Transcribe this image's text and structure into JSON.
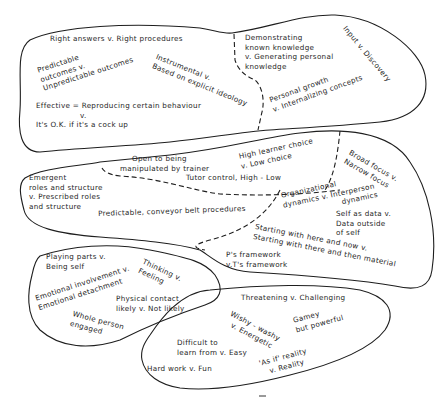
{
  "diagram": {
    "type": "cluster-map",
    "colors": {
      "ink": "#1e1e1e",
      "background": "#ffffff"
    },
    "clusters": [
      {
        "id": "cluster-1",
        "labels": [
          {
            "lines": [
              "Right answers  v.  Right procedures"
            ]
          },
          {
            "lines": [
              "Predictable",
              "outcomes v.",
              "Unpredictable outcomes"
            ]
          },
          {
            "lines": [
              "Instrumental v.",
              "Based on explicit ideology"
            ]
          },
          {
            "lines": [
              "Effective = Reproducing certain behaviour",
              "v.",
              "It's O.K. if it's a cock up"
            ]
          },
          {
            "lines": [
              "Demonstrating",
              "known knowledge",
              "v. Generating personal",
              "knowledge"
            ]
          },
          {
            "lines": [
              "Personal growth",
              "v. Internalizing concepts"
            ]
          },
          {
            "lines": [
              "Input v. Discovery"
            ]
          }
        ]
      },
      {
        "id": "cluster-2",
        "labels": [
          {
            "lines": [
              "Open to being",
              "manipulated by trainer"
            ]
          },
          {
            "lines": [
              "High learner choice",
              "v. Low choice"
            ]
          },
          {
            "lines": [
              "Broad focus v.",
              "Narrow focus"
            ]
          },
          {
            "lines": [
              "Emergent",
              "roles and structure",
              "v. Prescribed roles",
              "and structure"
            ]
          },
          {
            "lines": [
              "Tutor control, High - Low"
            ]
          },
          {
            "lines": [
              "Predictable, conveyor belt procedures"
            ]
          },
          {
            "lines": [
              "Organizational",
              "dynamics v. Interperson",
              "dynamics"
            ]
          },
          {
            "lines": [
              "Self as data v.",
              "Data outside",
              "of self"
            ]
          },
          {
            "lines": [
              "Starting with here and now v.",
              "Starting with there and then material"
            ]
          },
          {
            "lines": [
              "P's framework",
              "v.T's framework"
            ]
          }
        ]
      },
      {
        "id": "cluster-3",
        "labels": [
          {
            "lines": [
              "Playing parts v.",
              "Being self"
            ]
          },
          {
            "lines": [
              "Thinking v.",
              "Feeling"
            ]
          },
          {
            "lines": [
              "Emotional involvement v.",
              "Emotional detachment"
            ]
          },
          {
            "lines": [
              "Physical contact",
              "likely  v.  Not likely"
            ]
          },
          {
            "lines": [
              "Whole person",
              "engaged"
            ]
          }
        ]
      },
      {
        "id": "cluster-4",
        "labels": [
          {
            "lines": [
              "Threatening  v.  Challenging"
            ]
          },
          {
            "lines": [
              "Wishy - washy",
              "v. Energetic"
            ]
          },
          {
            "lines": [
              "Gamey",
              "but powerful"
            ]
          },
          {
            "lines": [
              "Difficult to",
              "learn from v. Easy"
            ]
          },
          {
            "lines": [
              "'As if' reality",
              "v. Reality"
            ]
          },
          {
            "lines": [
              "Hard work  v.  Fun"
            ]
          }
        ]
      }
    ]
  }
}
